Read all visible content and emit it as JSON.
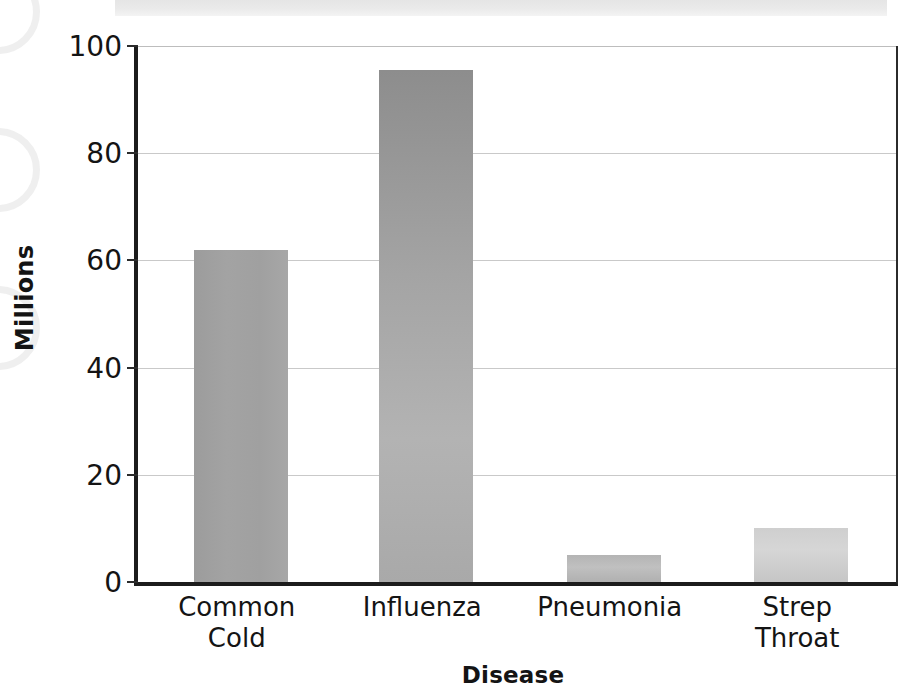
{
  "chart_data": {
    "type": "bar",
    "title": "",
    "subtitle": "",
    "xlabel": "Disease",
    "ylabel": "Millions",
    "categories": [
      "Common Cold",
      "Influenza",
      "Pneumonia",
      "Strep Throat"
    ],
    "category_lines": [
      [
        "Common",
        "Cold"
      ],
      [
        "Influenza"
      ],
      [
        "Pneumonia"
      ],
      [
        "Strep",
        "Throat"
      ]
    ],
    "values": [
      62,
      95.5,
      5,
      10
    ],
    "ylim": [
      0,
      100
    ],
    "xlim_note": "categorical",
    "y_ticks": [
      0,
      20,
      40,
      60,
      80,
      100
    ],
    "y_tick_labels": [
      "0",
      "20",
      "40",
      "60",
      "80",
      "100"
    ],
    "grid": "horizontal",
    "legend": "none",
    "annotations": [],
    "bar_colors": [
      "#a0a0a0",
      "#a4a4a4",
      "#b8b8b8",
      "#cfcfcf"
    ],
    "axis_color": "#1c1c1c",
    "gridline_color": "#c9c9c9",
    "background": "#ffffff"
  },
  "figure": {
    "y_axis_title": "Millions",
    "x_axis_title": "Disease"
  },
  "artifacts": {
    "top_strip_color": "#e9e9e9",
    "binding_ring_color": "#e9e9e9"
  }
}
